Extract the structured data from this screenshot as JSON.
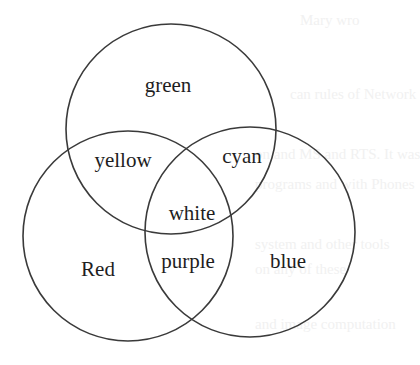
{
  "diagram": {
    "type": "venn",
    "stroke_color": "#3a3a3a",
    "background": "#ffffff",
    "circles": [
      {
        "id": "top",
        "color_name": "green",
        "cx": 171,
        "cy": 129,
        "r": 105
      },
      {
        "id": "left",
        "color_name": "Red",
        "cx": 128,
        "cy": 236,
        "r": 105
      },
      {
        "id": "right",
        "color_name": "blue",
        "cx": 250,
        "cy": 232,
        "r": 105
      }
    ],
    "regions": {
      "green": {
        "label": "green",
        "x": 168,
        "y": 92
      },
      "yellow": {
        "label": "yellow",
        "x": 123,
        "y": 167
      },
      "cyan": {
        "label": "cyan",
        "x": 242,
        "y": 163
      },
      "white": {
        "label": "white",
        "x": 192,
        "y": 220
      },
      "red": {
        "label": "Red",
        "x": 98,
        "y": 276
      },
      "purple": {
        "label": "purple",
        "x": 188,
        "y": 268
      },
      "blue": {
        "label": "blue",
        "x": 288,
        "y": 268
      }
    }
  },
  "ghost_text": [
    {
      "text": "Mary wro",
      "x": 300,
      "y": 26
    },
    {
      "text": "can rules of Network",
      "x": 290,
      "y": 100
    },
    {
      "text": "on and MS and RTS. It was",
      "x": 255,
      "y": 160
    },
    {
      "text": "programs and with Phones",
      "x": 255,
      "y": 190
    },
    {
      "text": "system and other tools",
      "x": 255,
      "y": 250
    },
    {
      "text": "on any of these",
      "x": 255,
      "y": 275
    },
    {
      "text": "and image computation",
      "x": 255,
      "y": 330
    }
  ]
}
